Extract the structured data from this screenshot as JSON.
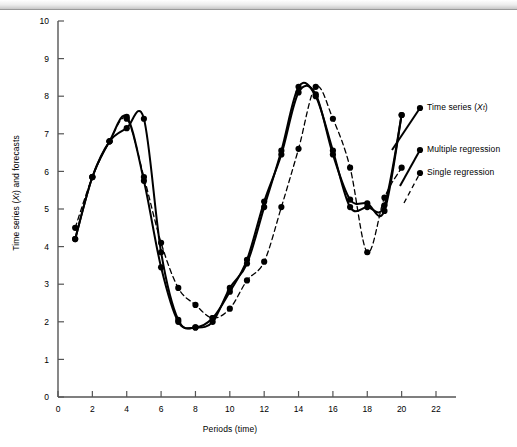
{
  "page": {
    "header_strip_text": "",
    "background": "#ffffff"
  },
  "axes": {
    "y_label": "Time series (Xt) and forecasts",
    "y_label_parts": {
      "pre": "Time series (",
      "var": "X",
      "sub": "t",
      "post": ") and forecasts"
    },
    "x_label": "Periods (time)",
    "y_ticks": [
      "0",
      "1",
      "2",
      "3",
      "4",
      "5",
      "6",
      "7",
      "8",
      "9",
      "10"
    ],
    "x_ticks": [
      "0",
      "2",
      "4",
      "6",
      "8",
      "10",
      "12",
      "14",
      "16",
      "18",
      "20",
      "22"
    ]
  },
  "legend": {
    "position": "right",
    "items": [
      {
        "label_pre": "Time series (",
        "label_var": "X",
        "label_sub": "t",
        "label_post": ")",
        "label": "Time series (Xt)",
        "style": "solid",
        "marker": "filled-circle",
        "color": "#000000"
      },
      {
        "label_pre": "Multiple regression",
        "label_var": "",
        "label_sub": "",
        "label_post": "",
        "label": "Multiple regression",
        "style": "solid",
        "marker": "filled-circle",
        "color": "#000000"
      },
      {
        "label_pre": "Single regression",
        "label_var": "",
        "label_sub": "",
        "label_post": "",
        "label": "Single regression",
        "style": "dashed",
        "marker": "filled-circle",
        "color": "#000000"
      }
    ]
  },
  "chart_data": {
    "type": "line",
    "title": "",
    "subtitle": "",
    "xlabel": "Periods (time)",
    "ylabel": "Time series (Xt) and forecasts",
    "xlim": [
      0,
      22
    ],
    "ylim": [
      0,
      10
    ],
    "xtick_step": 2,
    "ytick_step": 1,
    "grid": false,
    "legend_position": "right",
    "x": [
      1,
      2,
      3,
      4,
      5,
      6,
      7,
      8,
      9,
      10,
      11,
      12,
      13,
      14,
      15,
      16,
      17,
      18,
      19,
      20
    ],
    "series": [
      {
        "name": "Time series (Xt)",
        "style": "solid",
        "marker": "filled-circle",
        "color": "#000000",
        "values": [
          4.2,
          5.85,
          6.8,
          7.45,
          5.75,
          3.45,
          2.0,
          1.85,
          2.0,
          2.9,
          3.55,
          5.05,
          6.55,
          8.25,
          8.0,
          6.55,
          5.05,
          5.05,
          5.1,
          7.5
        ]
      },
      {
        "name": "Multiple regression",
        "style": "solid",
        "marker": "filled-circle",
        "color": "#000000",
        "values": [
          4.2,
          5.85,
          6.8,
          7.15,
          7.4,
          3.85,
          2.05,
          1.85,
          2.1,
          2.8,
          3.65,
          5.2,
          6.45,
          8.1,
          8.05,
          6.45,
          5.25,
          5.15,
          4.95,
          7.5
        ]
      },
      {
        "name": "Single regression",
        "style": "dashed",
        "marker": "filled-circle",
        "color": "#000000",
        "values": [
          4.5,
          5.85,
          6.8,
          7.4,
          5.85,
          4.1,
          2.9,
          2.45,
          2.1,
          2.35,
          3.1,
          3.6,
          5.05,
          6.6,
          8.25,
          7.4,
          6.1,
          3.85,
          5.3,
          6.1
        ]
      }
    ]
  }
}
